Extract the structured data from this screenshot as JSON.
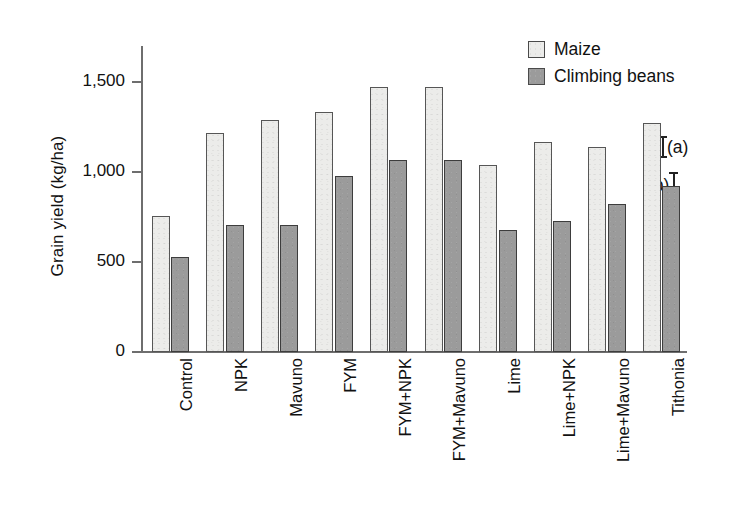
{
  "chart_data": {
    "type": "bar",
    "title": "",
    "xlabel": "",
    "ylabel": "Grain yield (kg/ha)",
    "ylim": [
      0,
      1700
    ],
    "yticks": [
      0,
      500,
      1000,
      1500
    ],
    "ytick_labels": [
      "0",
      "500",
      "1,000",
      "1,500"
    ],
    "grid": false,
    "legend_position": "top-right",
    "categories": [
      "Control",
      "NPK",
      "Mavuno",
      "FYM",
      "FYM+NPK",
      "FYM+Mavuno",
      "Lime",
      "Lime+NPK",
      "Lime+Mavuno",
      "Tithonia"
    ],
    "series": [
      {
        "name": "Maize",
        "color": "#ececea",
        "values": [
          755,
          1215,
          1290,
          1335,
          1470,
          1470,
          1040,
          1165,
          1140,
          1275
        ]
      },
      {
        "name": "Climbing beans",
        "color": "#9b9b9b",
        "values": [
          530,
          708,
          708,
          980,
          1065,
          1065,
          680,
          730,
          822,
          925
        ]
      }
    ],
    "annotations": [
      {
        "id": "a",
        "label": "(a)",
        "icon": "error-bar-i-beam",
        "icon_side": "left"
      },
      {
        "id": "b",
        "label": "(b)",
        "icon": "error-bar-i-beam",
        "icon_side": "right"
      }
    ]
  },
  "legend": {
    "items": [
      {
        "label": "Maize",
        "swatch": "maize"
      },
      {
        "label": "Climbing beans",
        "swatch": "beans"
      }
    ]
  },
  "axes": {
    "y_title": "Grain yield (kg/ha)"
  }
}
